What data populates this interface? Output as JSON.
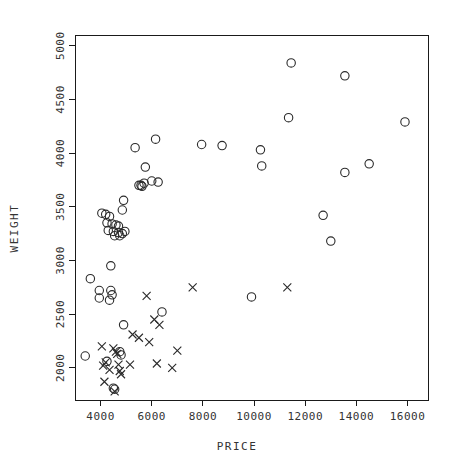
{
  "chart_data": {
    "type": "scatter",
    "title": "",
    "xlabel": "PRICE",
    "ylabel": "WEIGHT",
    "xlim": [
      3000,
      16800
    ],
    "ylim": [
      1700,
      5100
    ],
    "xticks": [
      4000,
      6000,
      8000,
      10000,
      12000,
      14000,
      16000
    ],
    "yticks": [
      2000,
      2500,
      3000,
      3500,
      4000,
      4500,
      5000
    ],
    "xtick_labels": [
      "4000",
      "6000",
      "8000",
      "10000",
      "12000",
      "14000",
      "16000"
    ],
    "ytick_labels": [
      "2000",
      "2500",
      "3000",
      "3500",
      "4000",
      "4500",
      "5000"
    ],
    "grid": false,
    "legend": false,
    "series": [
      {
        "name": "circle-series",
        "marker": "circle",
        "color": "#2a2a2a",
        "points": [
          [
            11450,
            4840
          ],
          [
            13550,
            4720
          ],
          [
            11350,
            4330
          ],
          [
            15900,
            4290
          ],
          [
            10300,
            3880
          ],
          [
            13550,
            3820
          ],
          [
            14500,
            3900
          ],
          [
            5350,
            4050
          ],
          [
            6150,
            4130
          ],
          [
            7950,
            4080
          ],
          [
            8750,
            4070
          ],
          [
            10250,
            4030
          ],
          [
            13000,
            3180
          ],
          [
            12700,
            3420
          ],
          [
            5750,
            3870
          ],
          [
            5500,
            3700
          ],
          [
            5580,
            3700
          ],
          [
            5620,
            3690
          ],
          [
            5700,
            3720
          ],
          [
            6000,
            3740
          ],
          [
            6250,
            3730
          ],
          [
            4900,
            3560
          ],
          [
            4850,
            3470
          ],
          [
            4050,
            3440
          ],
          [
            4200,
            3430
          ],
          [
            4350,
            3410
          ],
          [
            4250,
            3350
          ],
          [
            4450,
            3340
          ],
          [
            4600,
            3330
          ],
          [
            4700,
            3320
          ],
          [
            4300,
            3280
          ],
          [
            4500,
            3270
          ],
          [
            4700,
            3260
          ],
          [
            4850,
            3250
          ],
          [
            4950,
            3270
          ],
          [
            4550,
            3230
          ],
          [
            4750,
            3230
          ],
          [
            4400,
            2950
          ],
          [
            3600,
            2830
          ],
          [
            3950,
            2720
          ],
          [
            4400,
            2720
          ],
          [
            4450,
            2680
          ],
          [
            3950,
            2650
          ],
          [
            4350,
            2630
          ],
          [
            9900,
            2660
          ],
          [
            6400,
            2520
          ],
          [
            4900,
            2400
          ],
          [
            4750,
            2150
          ],
          [
            4800,
            2120
          ],
          [
            3400,
            2110
          ],
          [
            4250,
            2060
          ],
          [
            4500,
            1810
          ],
          [
            4550,
            1800
          ]
        ]
      },
      {
        "name": "cross-series",
        "marker": "x",
        "color": "#2a2a2a",
        "points": [
          [
            11300,
            2750
          ],
          [
            7600,
            2750
          ],
          [
            5800,
            2670
          ],
          [
            6100,
            2450
          ],
          [
            6300,
            2400
          ],
          [
            5250,
            2310
          ],
          [
            5900,
            2240
          ],
          [
            5500,
            2280
          ],
          [
            4050,
            2200
          ],
          [
            4500,
            2180
          ],
          [
            4600,
            2150
          ],
          [
            4650,
            2130
          ],
          [
            7000,
            2160
          ],
          [
            4200,
            2050
          ],
          [
            4100,
            2020
          ],
          [
            4700,
            2030
          ],
          [
            5150,
            2030
          ],
          [
            6200,
            2040
          ],
          [
            6800,
            2000
          ],
          [
            4350,
            1980
          ],
          [
            4750,
            1970
          ],
          [
            4800,
            1940
          ],
          [
            4150,
            1870
          ],
          [
            4550,
            1780
          ]
        ]
      }
    ]
  },
  "plot_geometry": {
    "frame_left": 75,
    "frame_right": 428,
    "frame_top": 35,
    "frame_bottom": 400
  },
  "axis_titles": {
    "x": "PRICE",
    "y": "WEIGHT"
  }
}
